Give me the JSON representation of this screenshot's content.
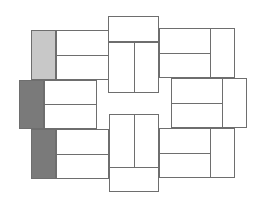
{
  "diagram": {
    "type": "pinwheel-tile-layout",
    "canvas": {
      "width": 262,
      "height": 207
    },
    "colors": {
      "stroke": "#6e6e6e",
      "background": "#ffffff",
      "white_tile": "#ffffff",
      "light_tile": "#c8c8c8",
      "dark_tile": "#7a7a7a"
    },
    "rects": [
      {
        "name": "top-center-block",
        "x": 108,
        "y": 16,
        "w": 51,
        "h": 77,
        "fill": "white_tile"
      },
      {
        "name": "bottom-center-block",
        "x": 109,
        "y": 114,
        "w": 50,
        "h": 78,
        "fill": "white_tile"
      },
      {
        "name": "top-left-gray-tile",
        "x": 31,
        "y": 30,
        "w": 25,
        "h": 50,
        "fill": "light_tile"
      },
      {
        "name": "top-left-white-block",
        "x": 56,
        "y": 30,
        "w": 53,
        "h": 50,
        "fill": "white_tile"
      },
      {
        "name": "middle-left-dark-tile",
        "x": 19,
        "y": 80,
        "w": 25,
        "h": 49,
        "fill": "dark_tile"
      },
      {
        "name": "middle-left-white-block",
        "x": 44,
        "y": 80,
        "w": 53,
        "h": 49,
        "fill": "white_tile"
      },
      {
        "name": "bottom-left-dark-tile",
        "x": 31,
        "y": 129,
        "w": 25,
        "h": 50,
        "fill": "dark_tile"
      },
      {
        "name": "bottom-left-white-block",
        "x": 56,
        "y": 129,
        "w": 53,
        "h": 50,
        "fill": "white_tile"
      },
      {
        "name": "top-right-block",
        "x": 159,
        "y": 28,
        "w": 76,
        "h": 50,
        "fill": "white_tile"
      },
      {
        "name": "middle-right-block",
        "x": 171,
        "y": 78,
        "w": 76,
        "h": 50,
        "fill": "white_tile"
      },
      {
        "name": "bottom-right-block",
        "x": 159,
        "y": 128,
        "w": 76,
        "h": 50,
        "fill": "white_tile"
      }
    ],
    "lines": [
      {
        "name": "top-center-h-divider",
        "x": 108,
        "y": 41,
        "w": 51,
        "h": 1.5
      },
      {
        "name": "top-center-v-divider",
        "x": 133.5,
        "y": 41,
        "w": 1.5,
        "h": 52
      },
      {
        "name": "bottom-center-h-divider",
        "x": 109,
        "y": 166.5,
        "w": 50,
        "h": 1.5
      },
      {
        "name": "bottom-center-v-divider",
        "x": 133.5,
        "y": 114,
        "w": 1.5,
        "h": 53
      },
      {
        "name": "top-left-h-divider",
        "x": 56,
        "y": 54.5,
        "w": 53,
        "h": 1.5
      },
      {
        "name": "middle-left-h-divider",
        "x": 44,
        "y": 103.5,
        "w": 53,
        "h": 1.5
      },
      {
        "name": "bottom-left-h-divider",
        "x": 56,
        "y": 153.5,
        "w": 53,
        "h": 1.5
      },
      {
        "name": "top-right-v-divider",
        "x": 209.5,
        "y": 28,
        "w": 1.5,
        "h": 50
      },
      {
        "name": "top-right-h-divider",
        "x": 159,
        "y": 52.5,
        "w": 51,
        "h": 1.5
      },
      {
        "name": "middle-right-v-divider",
        "x": 221.5,
        "y": 78,
        "w": 1.5,
        "h": 50
      },
      {
        "name": "middle-right-h-divider",
        "x": 171,
        "y": 102.5,
        "w": 51,
        "h": 1.5
      },
      {
        "name": "bottom-right-v-divider",
        "x": 209.5,
        "y": 128,
        "w": 1.5,
        "h": 50
      },
      {
        "name": "bottom-right-h-divider",
        "x": 159,
        "y": 152.5,
        "w": 51,
        "h": 1.5
      }
    ]
  }
}
